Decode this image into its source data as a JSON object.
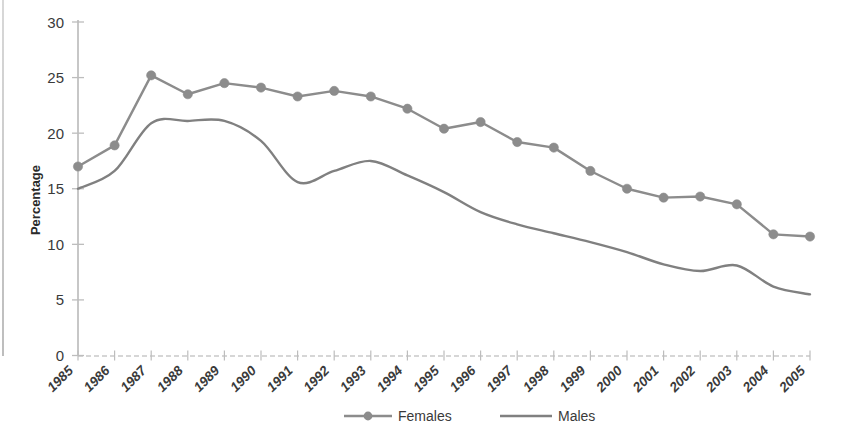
{
  "chart_data": {
    "type": "line",
    "title": "",
    "xlabel": "",
    "ylabel": "Percentage",
    "ylim": [
      0,
      30
    ],
    "yticks": [
      0,
      5,
      10,
      15,
      20,
      25,
      30
    ],
    "grid": false,
    "legend_position": "bottom",
    "categories": [
      "1985",
      "1986",
      "1987",
      "1988",
      "1989",
      "1990",
      "1991",
      "1992",
      "1993",
      "1994",
      "1995",
      "1996",
      "1997",
      "1998",
      "1999",
      "2000",
      "2001",
      "2002",
      "2003",
      "2004",
      "2005"
    ],
    "series": [
      {
        "name": "Females",
        "marker": "circle",
        "color": "#8c8c8c",
        "values": [
          17.0,
          18.9,
          25.2,
          23.5,
          24.5,
          24.1,
          23.3,
          23.8,
          23.3,
          22.2,
          20.4,
          21.0,
          19.2,
          18.7,
          16.6,
          15.0,
          14.2,
          14.3,
          13.6,
          10.9,
          10.7
        ]
      },
      {
        "name": "Males",
        "marker": "none",
        "color": "#808080",
        "values": [
          15.0,
          16.6,
          20.9,
          21.1,
          21.1,
          19.3,
          15.6,
          16.6,
          17.5,
          16.2,
          14.7,
          12.9,
          11.8,
          11.0,
          10.2,
          9.3,
          8.2,
          7.6,
          8.1,
          6.2,
          5.5
        ]
      }
    ]
  },
  "axes": {
    "y_title": "Percentage",
    "y_tick_labels": [
      "0",
      "5",
      "10",
      "15",
      "20",
      "25",
      "30"
    ],
    "x_tick_labels": [
      "1985",
      "1986",
      "1987",
      "1988",
      "1989",
      "1990",
      "1991",
      "1992",
      "1993",
      "1994",
      "1995",
      "1996",
      "1997",
      "1998",
      "1999",
      "2000",
      "2001",
      "2002",
      "2003",
      "2004",
      "2005"
    ]
  },
  "legend": {
    "items": [
      {
        "label": "Females",
        "marker": "circle-line",
        "color": "#8c8c8c"
      },
      {
        "label": "Males",
        "marker": "line",
        "color": "#808080"
      }
    ]
  },
  "colors": {
    "females": "#8c8c8c",
    "males": "#808080",
    "axis": "#b5b5b5",
    "text": "#3a3a3a",
    "background": "#ffffff"
  }
}
